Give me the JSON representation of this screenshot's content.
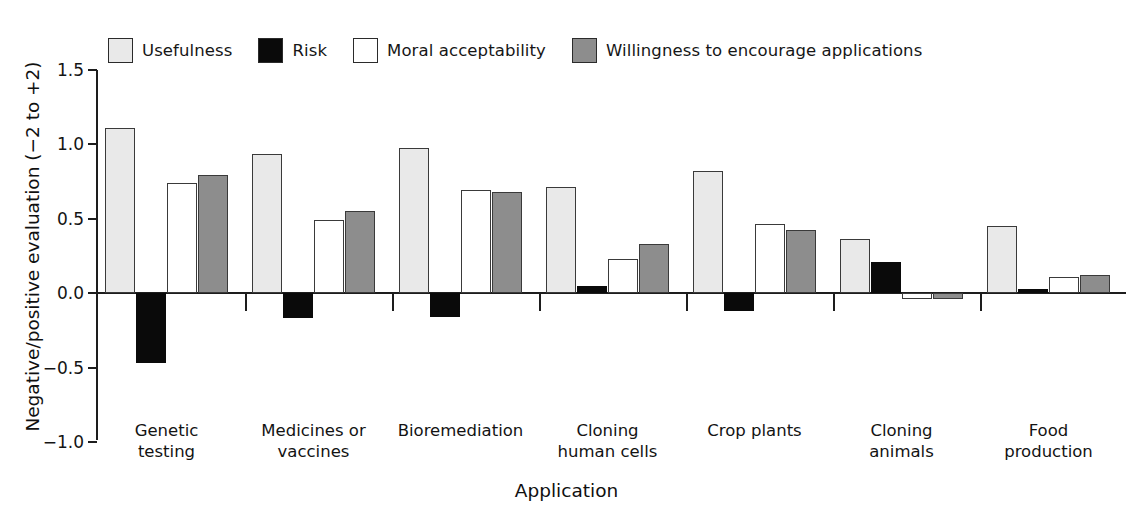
{
  "chart_data": {
    "type": "bar",
    "title": "",
    "xlabel": "Application",
    "ylabel": "Negative/positive evaluation (−2 to +2)",
    "ylim": [
      -1.0,
      1.5
    ],
    "yticks": [
      1.5,
      1.0,
      0.5,
      0.0,
      -0.5,
      -1.0
    ],
    "ytick_labels": [
      "1.5",
      "1.0",
      "0.5",
      "0.0",
      "−0.5",
      "−1.0"
    ],
    "grid": false,
    "legend_position": "top",
    "categories": [
      "Genetic testing",
      "Medicines or vaccines",
      "Bioremediation",
      "Cloning human cells",
      "Crop plants",
      "Cloning animals",
      "Food production"
    ],
    "category_lines": [
      [
        "Genetic",
        "testing"
      ],
      [
        "Medicines or",
        "vaccines"
      ],
      [
        "Bioremediation"
      ],
      [
        "Cloning",
        "human cells"
      ],
      [
        "Crop plants"
      ],
      [
        "Cloning",
        "animals"
      ],
      [
        "Food",
        "production"
      ]
    ],
    "series": [
      {
        "name": "Usefulness",
        "color": "#e9e9e9",
        "values": [
          1.11,
          0.93,
          0.97,
          0.71,
          0.82,
          0.36,
          0.45
        ]
      },
      {
        "name": "Risk",
        "color": "#0a0a0a",
        "values": [
          -0.47,
          -0.17,
          -0.16,
          0.05,
          -0.12,
          0.21,
          0.03
        ]
      },
      {
        "name": "Moral acceptability",
        "color": "#ffffff",
        "values": [
          0.74,
          0.49,
          0.69,
          0.23,
          0.46,
          -0.04,
          0.11
        ]
      },
      {
        "name": "Willingness to encourage applications",
        "color": "#8d8d8d",
        "values": [
          0.79,
          0.55,
          0.68,
          0.33,
          0.42,
          -0.04,
          0.12
        ]
      }
    ]
  },
  "legend": {
    "items": [
      {
        "label": "Usefulness",
        "swatch": "light-gray"
      },
      {
        "label": "Risk",
        "swatch": "black"
      },
      {
        "label": "Moral acceptability",
        "swatch": "white"
      },
      {
        "label": "Willingness to encourage applications",
        "swatch": "gray"
      }
    ]
  },
  "axes": {
    "y_title": "Negative/positive evaluation (−2 to +2)",
    "x_title": "Application"
  }
}
